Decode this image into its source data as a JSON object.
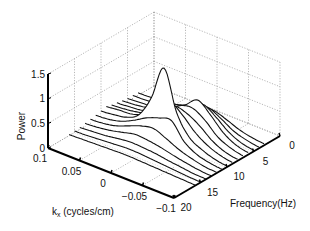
{
  "chart_data": {
    "type": "line",
    "subtype": "3d-waterfall",
    "title": "",
    "xlabel": "k_x (cycles/cm)",
    "ylabel": "Frequency(Hz)",
    "zlabel": "Power",
    "x_ticks": [
      "0.1",
      "0.05",
      "0",
      "-0.05",
      "-0.1"
    ],
    "y_ticks": [
      "0",
      "5",
      "10",
      "15",
      "20"
    ],
    "z_ticks": [
      "0",
      "0.5",
      "1",
      "1.5"
    ],
    "xlim": [
      -0.1,
      0.1
    ],
    "ylim": [
      0,
      20
    ],
    "zlim": [
      0,
      1.5
    ],
    "grid": true,
    "k_x": [
      0.1,
      0.08,
      0.06,
      0.04,
      0.02,
      0.0,
      -0.02,
      -0.04,
      -0.06,
      -0.08,
      -0.1
    ],
    "series": [
      {
        "frequency": 3,
        "values": [
          0.05,
          0.06,
          0.08,
          0.12,
          0.2,
          0.28,
          0.3,
          0.22,
          0.12,
          0.06,
          0.03
        ]
      },
      {
        "frequency": 4,
        "values": [
          0.06,
          0.07,
          0.1,
          0.15,
          0.25,
          0.38,
          0.42,
          0.3,
          0.15,
          0.07,
          0.03
        ]
      },
      {
        "frequency": 5,
        "values": [
          0.06,
          0.08,
          0.1,
          0.16,
          0.3,
          0.45,
          0.55,
          0.4,
          0.2,
          0.08,
          0.03
        ]
      },
      {
        "frequency": 6,
        "values": [
          0.08,
          0.1,
          0.14,
          0.2,
          0.35,
          0.5,
          0.7,
          0.5,
          0.25,
          0.1,
          0.04
        ]
      },
      {
        "frequency": 7,
        "values": [
          0.1,
          0.12,
          0.15,
          0.22,
          0.35,
          0.55,
          0.6,
          0.45,
          0.22,
          0.1,
          0.04
        ]
      },
      {
        "frequency": 8,
        "values": [
          0.12,
          0.14,
          0.18,
          0.25,
          0.4,
          0.6,
          0.55,
          0.4,
          0.2,
          0.08,
          0.03
        ]
      },
      {
        "frequency": 9,
        "values": [
          0.15,
          0.18,
          0.2,
          0.3,
          0.5,
          0.75,
          0.6,
          0.35,
          0.18,
          0.08,
          0.03
        ]
      },
      {
        "frequency": 10,
        "values": [
          0.12,
          0.15,
          0.2,
          0.35,
          0.8,
          1.5,
          0.7,
          0.3,
          0.15,
          0.06,
          0.02
        ]
      },
      {
        "frequency": 11,
        "values": [
          0.1,
          0.12,
          0.18,
          0.3,
          0.45,
          0.55,
          0.6,
          0.28,
          0.12,
          0.05,
          0.02
        ]
      },
      {
        "frequency": 12,
        "values": [
          0.08,
          0.1,
          0.15,
          0.25,
          0.35,
          0.4,
          0.3,
          0.18,
          0.1,
          0.04,
          0.02
        ]
      },
      {
        "frequency": 13,
        "values": [
          0.06,
          0.08,
          0.12,
          0.18,
          0.24,
          0.22,
          0.18,
          0.12,
          0.07,
          0.03,
          0.01
        ]
      },
      {
        "frequency": 14,
        "values": [
          0.04,
          0.06,
          0.08,
          0.12,
          0.15,
          0.14,
          0.12,
          0.08,
          0.05,
          0.02,
          0.01
        ]
      },
      {
        "frequency": 15,
        "values": [
          0.03,
          0.04,
          0.06,
          0.08,
          0.1,
          0.1,
          0.08,
          0.06,
          0.04,
          0.02,
          0.01
        ]
      },
      {
        "frequency": 16,
        "values": [
          0.02,
          0.03,
          0.04,
          0.05,
          0.06,
          0.06,
          0.05,
          0.04,
          0.03,
          0.02,
          0.01
        ]
      }
    ]
  }
}
